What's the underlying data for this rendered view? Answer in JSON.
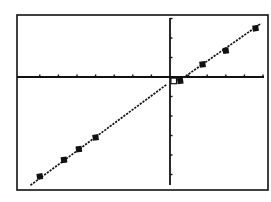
{
  "chart_data": {
    "type": "line",
    "title": "",
    "xlabel": "",
    "ylabel": "",
    "grid": false,
    "legend": null,
    "axis_ticks": {
      "x_ticks": [
        -7,
        -6,
        -5,
        -4,
        -3,
        -2,
        -1,
        1,
        2,
        3,
        4,
        5
      ],
      "y_ticks": [
        3,
        2,
        1,
        -1,
        -2,
        -3,
        -4,
        -5
      ]
    },
    "xlim": [
      -8.2,
      5.2
    ],
    "ylim": [
      -5.8,
      3.2
    ],
    "series": [
      {
        "name": "line",
        "style": "dotted-pixel line",
        "segments": [
          {
            "x": [
              -7.5,
              -0.2
            ],
            "y": [
              -5.55,
              -0.4
            ]
          },
          {
            "x": [
              0.85,
              4.9
            ],
            "y": [
              0.05,
              2.75
            ]
          }
        ]
      },
      {
        "name": "filled-points",
        "marker": "filled-square",
        "points": [
          {
            "x": -7.0,
            "y": -5.1
          },
          {
            "x": -5.7,
            "y": -4.25
          },
          {
            "x": -4.9,
            "y": -3.7
          },
          {
            "x": -4.0,
            "y": -3.1
          },
          {
            "x": 0.55,
            "y": -0.2
          },
          {
            "x": 1.75,
            "y": 0.65
          },
          {
            "x": 3.0,
            "y": 1.35
          },
          {
            "x": 4.6,
            "y": 2.5
          }
        ]
      },
      {
        "name": "open-point",
        "marker": "open-square",
        "points": [
          {
            "x": 0.2,
            "y": -0.2
          }
        ]
      }
    ]
  },
  "colors": {
    "background": "#ffffff",
    "ink": "#111111"
  },
  "layout": {
    "frame": {
      "left": 17,
      "top": 15,
      "right": 268,
      "bottom": 190
    },
    "origin_px": {
      "x": 170,
      "y": 77
    },
    "px_per_unit": {
      "x": 18.6,
      "y": 19.5
    }
  }
}
